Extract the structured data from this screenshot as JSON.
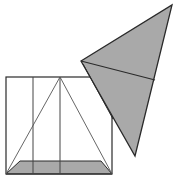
{
  "diagram": {
    "type": "geometry-figure",
    "colors": {
      "background": "#ffffff",
      "stroke": "#2a2a2a",
      "thin_stroke": "#555555",
      "fill": "#a9a9a9"
    },
    "square": {
      "x": 6,
      "y": 77,
      "width": 106,
      "height": 97
    },
    "vertical_lines": [
      {
        "x": 33,
        "y1": 77,
        "y2": 174
      },
      {
        "x": 60,
        "y1": 77,
        "y2": 174
      }
    ],
    "inscribed_triangle": {
      "points": "6,174 60,77 112,174"
    },
    "bottom_trapezoid": {
      "points": "6,174 20,161 101,161 112,174"
    },
    "folded_triangle": {
      "points": "81,61 172,5 135,156",
      "fold_line": {
        "x1": 81,
        "y1": 61,
        "x2": 155,
        "y2": 80
      },
      "edge_double": {
        "x1": 83,
        "y1": 64,
        "x2": 113,
        "y2": 119
      }
    }
  }
}
